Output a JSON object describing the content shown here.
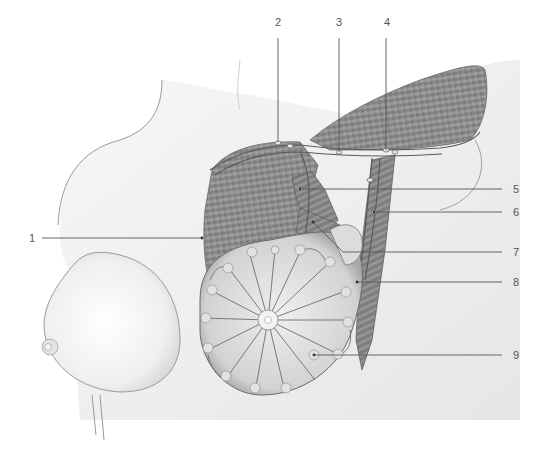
{
  "figure": {
    "type": "anatomical-illustration",
    "colors": {
      "background": "#ffffff",
      "skin": "#f2f2f2",
      "skin_outline": "#9a9a9a",
      "muscle": "#8a8a8a",
      "muscle_dark": "#6e6e6e",
      "gland": "#d9d9d9",
      "vessel": "#5a5a5a",
      "leader_line": "#555555",
      "label_text": "#555555"
    }
  },
  "labels": [
    {
      "id": "1",
      "text": "1",
      "x": 32,
      "y": 238,
      "line": {
        "x1": 42,
        "y1": 238,
        "x2": 202,
        "y2": 238
      }
    },
    {
      "id": "2",
      "text": "2",
      "x": 277,
      "y": 22,
      "line": {
        "x1": 278,
        "y1": 38,
        "x2": 278,
        "y2": 142
      }
    },
    {
      "id": "3",
      "text": "3",
      "x": 339,
      "y": 22,
      "line": {
        "x1": 339,
        "y1": 38,
        "x2": 339,
        "y2": 152
      }
    },
    {
      "id": "4",
      "text": "4",
      "x": 387,
      "y": 22,
      "line": {
        "x1": 386,
        "y1": 38,
        "x2": 386,
        "y2": 150
      }
    },
    {
      "id": "5",
      "text": "5",
      "x": 516,
      "y": 189,
      "line": {
        "x1": 300,
        "y1": 189,
        "x2": 502,
        "y2": 189
      }
    },
    {
      "id": "6",
      "text": "6",
      "x": 516,
      "y": 212,
      "line": {
        "x1": 374,
        "y1": 212,
        "x2": 502,
        "y2": 212
      }
    },
    {
      "id": "7",
      "text": "7",
      "x": 516,
      "y": 252,
      "line": {
        "x1": 360,
        "y1": 252,
        "x2": 502,
        "y2": 252
      }
    },
    {
      "id": "8",
      "text": "8",
      "x": 516,
      "y": 282,
      "line": {
        "x1": 357,
        "y1": 282,
        "x2": 502,
        "y2": 282
      }
    },
    {
      "id": "9",
      "text": "9",
      "x": 516,
      "y": 355,
      "line": {
        "x1": 314,
        "y1": 355,
        "x2": 502,
        "y2": 355
      }
    }
  ]
}
